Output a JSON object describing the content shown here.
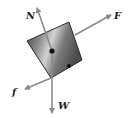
{
  "diagram": {
    "type": "free-body-diagram",
    "colors": {
      "arrow": "#8a8a8a",
      "label": "#222222",
      "block_dark": "#3a3a3a",
      "block_light": "#c8c8c8",
      "dot": "#111111"
    },
    "forces": [
      {
        "id": "normal",
        "label": "N"
      },
      {
        "id": "applied",
        "label": "F"
      },
      {
        "id": "friction",
        "label": "f"
      },
      {
        "id": "weight",
        "label": "W"
      }
    ]
  }
}
